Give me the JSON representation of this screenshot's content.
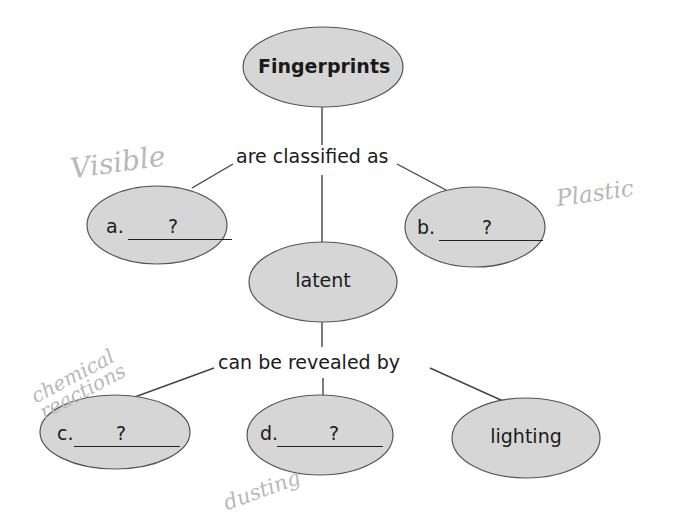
{
  "diagram": {
    "type": "concept-map",
    "root": {
      "label": "Fingerprints"
    },
    "link_1": {
      "label": "are classified as"
    },
    "classes": [
      {
        "letter": "a.",
        "placeholder": "?",
        "handwritten_answer": "Visible"
      },
      {
        "letter": "",
        "label": "latent"
      },
      {
        "letter": "b.",
        "placeholder": "?",
        "handwritten_answer": "Plastic"
      }
    ],
    "link_2": {
      "label": "can be revealed by"
    },
    "methods": [
      {
        "letter": "c.",
        "placeholder": "?",
        "handwritten_answer": "chemical reactions"
      },
      {
        "letter": "d.",
        "placeholder": "?",
        "handwritten_answer": "dusting"
      },
      {
        "letter": "",
        "label": "lighting"
      }
    ],
    "colors": {
      "node_fill": "#d6d6d6",
      "node_stroke": "#555555",
      "text": "#1a1a1a",
      "handwriting": "#b8b8b8"
    }
  }
}
